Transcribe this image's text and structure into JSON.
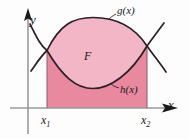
{
  "figure": {
    "type": "math-area-between-curves-diagram",
    "background_color": "#fdfdfd",
    "axes": {
      "x_label": "x",
      "y_label": "y",
      "axis_color": "#9a9a9a",
      "arrow_color": "#1a1a1a"
    },
    "curves": [
      {
        "name": "upper-curve",
        "label": "g(x)",
        "color": "#2b2026",
        "role": "upper boundary of region F"
      },
      {
        "name": "lower-curve",
        "label": "h(x)",
        "color": "#2b2026",
        "role": "lower boundary of region F"
      }
    ],
    "region": {
      "label": "F",
      "lens_fill": "#f2b6c6",
      "block_fill": "#e8899f",
      "description": "area between g(x) and h(x) from x1 to x2"
    },
    "bounds": {
      "left_label": "x",
      "left_sub": "1",
      "right_label": "x",
      "right_sub": "2"
    }
  }
}
